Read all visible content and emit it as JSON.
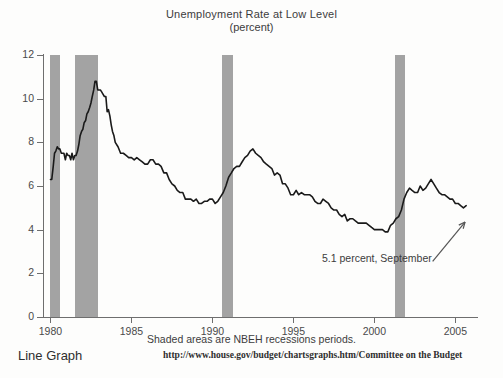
{
  "chart_data": {
    "type": "line",
    "title": "Unemployment Rate at Low Level",
    "subtitle": "(percent)",
    "xlabel": "",
    "ylabel": "",
    "xlim": [
      1979.6,
      2006.4
    ],
    "ylim": [
      0,
      12
    ],
    "grid": false,
    "legend": "none",
    "x_ticks": [
      1980,
      1985,
      1990,
      1995,
      2000,
      2005
    ],
    "x_tick_labels": [
      "1980",
      "1985",
      "1990",
      "1995",
      "2000",
      "2005"
    ],
    "y_ticks": [
      0,
      2,
      4,
      6,
      8,
      10,
      12
    ],
    "y_tick_labels": [
      "0",
      "2",
      "4",
      "6",
      "8",
      "10",
      "12"
    ],
    "line_color": "#1a1a1a",
    "shade_color": "#a3a3a3",
    "shaded_regions": [
      {
        "label": "recession-1980",
        "start": 1980.0,
        "end": 1980.58
      },
      {
        "label": "recession-1981-1982",
        "start": 1981.5,
        "end": 1982.92
      },
      {
        "label": "recession-1990-1991",
        "start": 1990.58,
        "end": 1991.25
      },
      {
        "label": "recession-2001",
        "start": 2001.25,
        "end": 2001.92
      }
    ],
    "annotation": {
      "text": "5.1 percent, September",
      "value": 5.1,
      "arrow_from": [
        2003.6,
        2.55
      ],
      "arrow_to": [
        2005.6,
        4.35
      ]
    },
    "series": [
      {
        "name": "Unemployment Rate",
        "x": [
          1980.0,
          1980.08,
          1980.17,
          1980.25,
          1980.33,
          1980.42,
          1980.5,
          1980.58,
          1980.67,
          1980.75,
          1980.83,
          1980.92,
          1981.0,
          1981.08,
          1981.17,
          1981.25,
          1981.33,
          1981.42,
          1981.5,
          1981.58,
          1981.67,
          1981.75,
          1981.83,
          1981.92,
          1982.0,
          1982.08,
          1982.17,
          1982.25,
          1982.33,
          1982.42,
          1982.5,
          1982.58,
          1982.67,
          1982.75,
          1982.83,
          1982.92,
          1983.0,
          1983.08,
          1983.17,
          1983.25,
          1983.33,
          1983.42,
          1983.5,
          1983.58,
          1983.67,
          1983.75,
          1983.83,
          1983.92,
          1984.0,
          1984.17,
          1984.33,
          1984.5,
          1984.67,
          1984.83,
          1985.0,
          1985.17,
          1985.33,
          1985.5,
          1985.67,
          1985.83,
          1986.0,
          1986.17,
          1986.33,
          1986.5,
          1986.67,
          1986.83,
          1987.0,
          1987.17,
          1987.33,
          1987.5,
          1987.67,
          1987.83,
          1988.0,
          1988.17,
          1988.33,
          1988.5,
          1988.67,
          1988.83,
          1989.0,
          1989.17,
          1989.33,
          1989.5,
          1989.67,
          1989.83,
          1990.0,
          1990.17,
          1990.33,
          1990.5,
          1990.67,
          1990.83,
          1991.0,
          1991.17,
          1991.33,
          1991.5,
          1991.67,
          1991.83,
          1992.0,
          1992.17,
          1992.33,
          1992.5,
          1992.67,
          1992.83,
          1993.0,
          1993.17,
          1993.33,
          1993.5,
          1993.67,
          1993.83,
          1994.0,
          1994.17,
          1994.33,
          1994.5,
          1994.67,
          1994.83,
          1995.0,
          1995.17,
          1995.33,
          1995.5,
          1995.67,
          1995.83,
          1996.0,
          1996.17,
          1996.33,
          1996.5,
          1996.67,
          1996.83,
          1997.0,
          1997.17,
          1997.33,
          1997.5,
          1997.67,
          1997.83,
          1998.0,
          1998.17,
          1998.33,
          1998.5,
          1998.67,
          1998.83,
          1999.0,
          1999.17,
          1999.33,
          1999.5,
          1999.67,
          1999.83,
          2000.0,
          2000.17,
          2000.33,
          2000.5,
          2000.67,
          2000.83,
          2001.0,
          2001.17,
          2001.33,
          2001.5,
          2001.67,
          2001.83,
          2002.0,
          2002.17,
          2002.33,
          2002.5,
          2002.67,
          2002.83,
          2003.0,
          2003.17,
          2003.33,
          2003.5,
          2003.67,
          2003.83,
          2004.0,
          2004.17,
          2004.33,
          2004.5,
          2004.67,
          2004.83,
          2005.0,
          2005.17,
          2005.33,
          2005.5,
          2005.67
        ],
        "values": [
          6.3,
          6.3,
          6.9,
          7.5,
          7.6,
          7.8,
          7.7,
          7.7,
          7.5,
          7.5,
          7.5,
          7.2,
          7.5,
          7.4,
          7.4,
          7.2,
          7.5,
          7.2,
          7.4,
          7.4,
          7.6,
          7.9,
          8.3,
          8.5,
          8.6,
          8.9,
          9.0,
          9.3,
          9.4,
          9.6,
          9.8,
          10.1,
          10.4,
          10.8,
          10.8,
          10.4,
          10.4,
          10.4,
          10.3,
          10.2,
          10.1,
          10.1,
          9.4,
          9.5,
          9.2,
          8.8,
          8.5,
          8.3,
          8.0,
          7.8,
          7.5,
          7.5,
          7.4,
          7.3,
          7.3,
          7.2,
          7.3,
          7.2,
          7.1,
          7.0,
          7.0,
          7.2,
          7.2,
          7.0,
          7.0,
          6.9,
          6.6,
          6.6,
          6.3,
          6.1,
          6.0,
          5.8,
          5.7,
          5.7,
          5.4,
          5.4,
          5.4,
          5.3,
          5.4,
          5.2,
          5.2,
          5.3,
          5.3,
          5.4,
          5.4,
          5.2,
          5.3,
          5.5,
          5.7,
          6.0,
          6.4,
          6.6,
          6.8,
          6.9,
          6.9,
          7.1,
          7.3,
          7.4,
          7.6,
          7.7,
          7.5,
          7.4,
          7.3,
          7.1,
          7.0,
          6.9,
          6.8,
          6.5,
          6.6,
          6.5,
          6.1,
          6.1,
          5.9,
          5.6,
          5.6,
          5.8,
          5.6,
          5.7,
          5.6,
          5.6,
          5.6,
          5.5,
          5.3,
          5.2,
          5.2,
          5.4,
          5.3,
          5.2,
          5.0,
          4.9,
          4.9,
          4.7,
          4.6,
          4.7,
          4.4,
          4.5,
          4.5,
          4.4,
          4.3,
          4.3,
          4.3,
          4.3,
          4.2,
          4.1,
          4.0,
          4.0,
          4.0,
          4.0,
          3.9,
          3.9,
          4.2,
          4.3,
          4.5,
          4.6,
          4.9,
          5.4,
          5.7,
          5.9,
          5.8,
          5.7,
          5.7,
          6.0,
          5.8,
          5.9,
          6.1,
          6.3,
          6.1,
          5.9,
          5.7,
          5.6,
          5.6,
          5.5,
          5.4,
          5.4,
          5.2,
          5.2,
          5.1,
          5.0,
          5.1
        ]
      }
    ]
  },
  "footer": {
    "caption": "Shaded areas are NBEH recessions periods.",
    "line_graph_label": "Line Graph",
    "url": "http://www.house.gov/budget/chartsgraphs.htm/Committee on the Budget"
  }
}
